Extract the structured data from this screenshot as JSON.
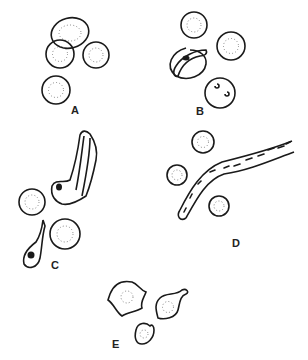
{
  "figure": {
    "panels": [
      {
        "id": "A",
        "label": "A",
        "description": "Normal round red cells with central pallor (dotted)"
      },
      {
        "id": "B",
        "label": "B",
        "description": "Red cells with a sickled/crescent cell containing dark inclusion and ring-form inclusions"
      },
      {
        "id": "C",
        "label": "C",
        "description": "Elongated twisted cell with nucleus; tear-drop shaped nucleated cell; normal red cells"
      },
      {
        "id": "D",
        "label": "D",
        "description": "Elongated curved band containing rod-like inclusions; normal red cells"
      },
      {
        "id": "E",
        "label": "E",
        "description": "Irregular crenated/fragmented cells (schistocyte-like)"
      }
    ]
  },
  "colors": {
    "stroke": "#1a1a1a",
    "dots": "#777777",
    "background": "#ffffff"
  }
}
